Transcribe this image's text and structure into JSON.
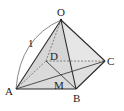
{
  "diagram": {
    "vertices": {
      "O": "O",
      "A": "A",
      "B": "B",
      "C": "C",
      "D": "D",
      "M": "M"
    },
    "edge_label": "1",
    "colors": {
      "face_fill": "#d9d9d9",
      "face_fill_light": "#ececec",
      "edge": "#2b2b2b",
      "hidden_edge": "#6a6a6a",
      "arc": "#555555"
    }
  }
}
